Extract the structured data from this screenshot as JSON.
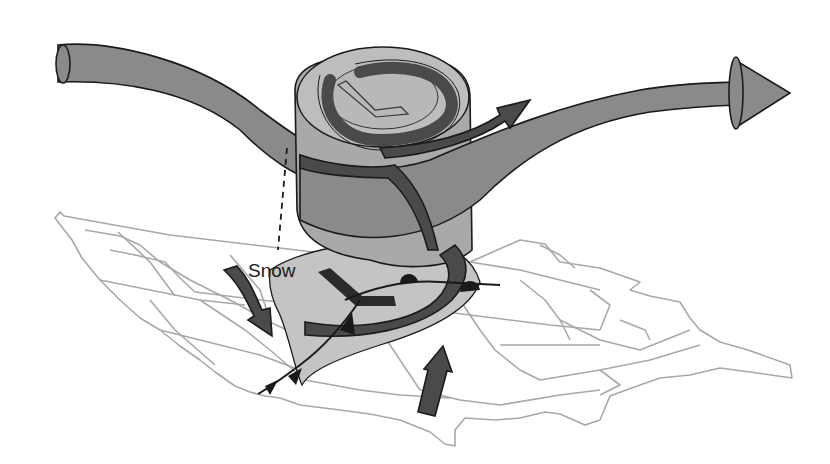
{
  "diagram": {
    "labels": {
      "snow": "Snow",
      "upper_low_symbol": "L",
      "surface_low_symbol": "L"
    },
    "elements": [
      {
        "name": "jet-stream",
        "description": "Large grey trough-shaped arrow flowing west to east across the top"
      },
      {
        "name": "upper-level-low-cylinder",
        "description": "Vertical cylinder tilting from surface low up to upper low"
      },
      {
        "name": "spiral-airflow",
        "description": "Dark spiral arrow rising counterclockwise around the low"
      },
      {
        "name": "cold-front",
        "description": "Front with triangles extending southwest from the low"
      },
      {
        "name": "warm-front",
        "description": "Front with semicircles extending east from the low"
      },
      {
        "name": "cold-air-arrow",
        "description": "Dark arrow from the northwest moving southeast"
      },
      {
        "name": "warm-air-arrow",
        "description": "Dark arrow from the Gulf moving north"
      },
      {
        "name": "precipitation-shield",
        "description": "Light grey shaded region around the surface low"
      },
      {
        "name": "us-map",
        "description": "Perspective outline map of the contiguous United States with state borders"
      }
    ],
    "colors": {
      "jet": "#8a8a8a",
      "cylinder_top": "#bdbdbd",
      "cylinder_side": "#a9a9a9",
      "spiral": "#4a4a4a",
      "shield": "#c4c4c4",
      "map": "#a8a8a8",
      "outline": "#1a1a1a"
    }
  }
}
